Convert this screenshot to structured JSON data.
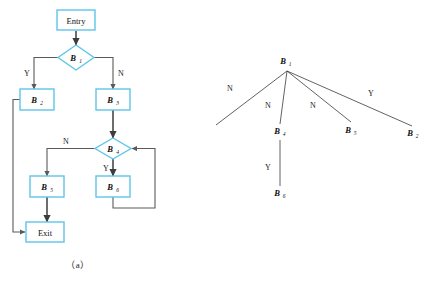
{
  "figure": {
    "panel_a": {
      "caption": "（a）",
      "type": "flowchart",
      "nodes": [
        {
          "id": "entry",
          "label": "Entry",
          "sub": "",
          "shape": "box"
        },
        {
          "id": "b1",
          "label": "B",
          "sub": "1",
          "shape": "diamond"
        },
        {
          "id": "b2",
          "label": "B",
          "sub": "2",
          "shape": "box"
        },
        {
          "id": "b3",
          "label": "B",
          "sub": "3",
          "shape": "box"
        },
        {
          "id": "b4",
          "label": "B",
          "sub": "4",
          "shape": "diamond"
        },
        {
          "id": "b5",
          "label": "B",
          "sub": "5",
          "shape": "box"
        },
        {
          "id": "b6",
          "label": "B",
          "sub": "6",
          "shape": "box"
        },
        {
          "id": "exit",
          "label": "Exit",
          "sub": "",
          "shape": "box"
        }
      ],
      "edges": [
        {
          "from": "entry",
          "to": "b1",
          "label": ""
        },
        {
          "from": "b1",
          "to": "b2",
          "label": "Y"
        },
        {
          "from": "b1",
          "to": "b3",
          "label": "N"
        },
        {
          "from": "b3",
          "to": "b4",
          "label": ""
        },
        {
          "from": "b4",
          "to": "b5",
          "label": "N"
        },
        {
          "from": "b4",
          "to": "b6",
          "label": "Y"
        },
        {
          "from": "b6",
          "to": "b4",
          "label": ""
        },
        {
          "from": "b2",
          "to": "exit",
          "label": ""
        },
        {
          "from": "b5",
          "to": "exit",
          "label": ""
        }
      ],
      "edge_labels": {
        "b1_yes": "Y",
        "b1_no": "N",
        "b4_no": "N",
        "b4_yes": "Y"
      }
    },
    "panel_b": {
      "caption": "（b）",
      "type": "tree",
      "root": {
        "label": "B",
        "sub": "1"
      },
      "leaves": [
        {
          "label": "B",
          "sub": "3",
          "edge_label": "N"
        },
        {
          "label": "B",
          "sub": "4",
          "edge_label": "N"
        },
        {
          "label": "B",
          "sub": "5",
          "edge_label": "N"
        },
        {
          "label": "B",
          "sub": "2",
          "edge_label": "Y"
        }
      ],
      "child": {
        "label": "B",
        "sub": "6",
        "edge_label": "Y",
        "parent_sub": "4"
      }
    }
  },
  "colors": {
    "shape_border": "#5ec5e8",
    "shape_fill": "#ffffff",
    "flow_line": "#5a5a5a",
    "tree_line": "#3a3a3a",
    "text": "#111111",
    "background": "#ffffff"
  }
}
